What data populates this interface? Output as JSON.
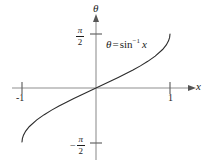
{
  "figure": {
    "name": "inverse-sine-graph",
    "background_color": "#ffffff",
    "axis_color": "#b4b4b4",
    "curve_color": "#2b2b2b",
    "text_color": "#1c1c1c"
  },
  "axes": {
    "horizontal": {
      "label": "x",
      "ticks": [
        {
          "label": "-1",
          "value": -1
        },
        {
          "label": "1",
          "value": 1
        }
      ]
    },
    "vertical": {
      "label": "θ",
      "ticks": [
        {
          "label": "π/2",
          "value": 1.5708,
          "sign": "",
          "numerator": "π",
          "denominator": "2"
        },
        {
          "label": "-π/2",
          "value": -1.5708,
          "sign": "−",
          "numerator": "π",
          "denominator": "2"
        }
      ]
    }
  },
  "annotation": {
    "theta": "θ",
    "equals": "=",
    "function": "sin",
    "exponent": "−1",
    "variable": "x"
  },
  "chart_data": {
    "type": "line",
    "title": "",
    "subtitle": "",
    "xlabel": "x",
    "ylabel": "θ",
    "grid": false,
    "legend": null,
    "annotations": [
      {
        "text": "θ = sin⁻¹ x",
        "x": 0.35,
        "y": 1.15
      }
    ],
    "xlim": [
      -1.25,
      1.25
    ],
    "ylim": [
      -1.9,
      1.9
    ],
    "xticks": [
      -1,
      1
    ],
    "xticklabels": [
      "-1",
      "1"
    ],
    "yticks": [
      -1.5708,
      1.5708
    ],
    "yticklabels": [
      "-π/2",
      "π/2"
    ],
    "series": [
      {
        "name": "θ = sin⁻¹ x",
        "x": [
          -1,
          -0.995,
          -0.98,
          -0.95,
          -0.9,
          -0.8,
          -0.7,
          -0.6,
          -0.5,
          -0.4,
          -0.3,
          -0.2,
          -0.1,
          0,
          0.1,
          0.2,
          0.3,
          0.4,
          0.5,
          0.6,
          0.7,
          0.8,
          0.9,
          0.95,
          0.98,
          0.995,
          1
        ],
        "y": [
          -1.5708,
          -1.4709,
          -1.3706,
          -1.2531,
          -1.1198,
          -0.9273,
          -0.7754,
          -0.6435,
          -0.5236,
          -0.4115,
          -0.3047,
          -0.2014,
          -0.1002,
          0,
          0.1002,
          0.2014,
          0.3047,
          0.4115,
          0.5236,
          0.6435,
          0.7754,
          0.9273,
          1.1198,
          1.2531,
          1.3706,
          1.4709,
          1.5708
        ]
      }
    ]
  }
}
